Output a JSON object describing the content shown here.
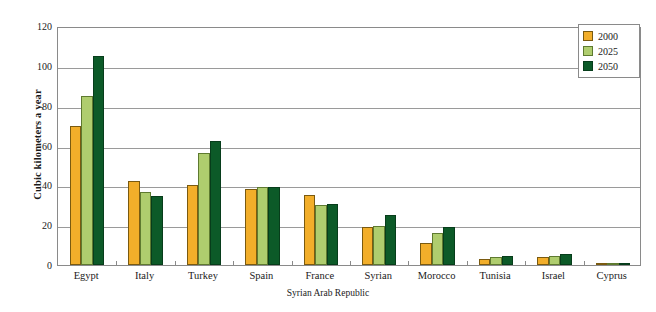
{
  "chart_data": {
    "type": "bar",
    "title": "",
    "subtitle": "",
    "xlabel": "Syrian Arab Republic",
    "ylabel": "Cubic kilometers a year",
    "ylim": [
      0,
      120
    ],
    "ytick_values": [
      0,
      20,
      40,
      60,
      80,
      100,
      120
    ],
    "ytick_labels": [
      "0",
      "20",
      "40",
      "60",
      "80",
      "100",
      "120"
    ],
    "grid": true,
    "grid_axis": "y",
    "legend_position": "top-right",
    "categories": [
      "Egypt",
      "Italy",
      "Turkey",
      "Spain",
      "France",
      "Syrian",
      "Morocco",
      "Tunisia",
      "Israel",
      "Cyprus"
    ],
    "series": [
      {
        "name": "2000",
        "color": "#F2AE2A",
        "values": [
          70,
          42,
          40,
          38,
          35,
          19,
          11,
          3,
          4,
          1
        ]
      },
      {
        "name": "2025",
        "color": "#AFCD6E",
        "values": [
          85,
          36.5,
          56,
          39,
          30,
          19.5,
          16,
          4,
          4.5,
          1
        ]
      },
      {
        "name": "2050",
        "color": "#0C5A28",
        "values": [
          105,
          34.5,
          62.5,
          39,
          30.5,
          25,
          19,
          4.5,
          5.5,
          1
        ]
      }
    ]
  },
  "legend": {
    "items": [
      {
        "label": "2000",
        "swatch": "s0"
      },
      {
        "label": "2025",
        "swatch": "s1"
      },
      {
        "label": "2050",
        "swatch": "s2"
      }
    ]
  }
}
